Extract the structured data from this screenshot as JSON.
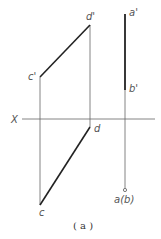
{
  "diagram": {
    "axis_label": "X",
    "caption": "( a )",
    "points": {
      "a_prime": "a'",
      "b_prime": "b'",
      "c_prime": "c'",
      "d_prime": "d'",
      "c": "c",
      "d": "d",
      "ab": "a(b)"
    },
    "colors": {
      "line": "#222222",
      "thin": "#666666",
      "label": "#555555"
    }
  }
}
